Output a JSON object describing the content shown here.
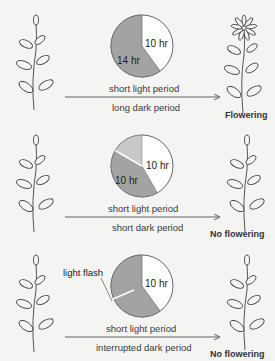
{
  "figure": {
    "panels": [
      {
        "pie_light_label": "10 hr",
        "pie_dark_label": "14 hr",
        "light_label": "short light period",
        "dark_label": "long dark period",
        "result": "Flowering",
        "light_hours": 10,
        "dark_hours": 14
      },
      {
        "pie_light_label": "10 hr",
        "pie_dark_label": "10 hr",
        "light_label": "short light period",
        "dark_label": "short dark period",
        "result": "No flowering",
        "light_hours": 10,
        "dark_hours": 10
      },
      {
        "pie_light_label": "10 hr",
        "flash_label": "light flash",
        "light_label": "short light period",
        "dark_label": "interrupted dark period",
        "result": "No flowering",
        "light_hours": 10,
        "dark_hours": 14
      }
    ],
    "colors": {
      "background": "#f4f4f2",
      "dark_period": "#a3a3a3",
      "light_period": "#ffffff",
      "extra_period": "#c8c8c8",
      "line": "#555555"
    }
  }
}
